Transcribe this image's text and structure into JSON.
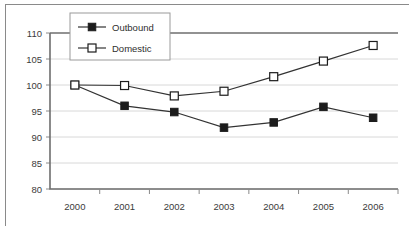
{
  "chart_data": {
    "type": "line",
    "title": "",
    "xlabel": "",
    "ylabel": "",
    "categories": [
      "2000",
      "2001",
      "2002",
      "2003",
      "2004",
      "2005",
      "2006"
    ],
    "series": [
      {
        "name": "Outbound",
        "marker": "filled-square",
        "values": [
          100.0,
          96.0,
          94.8,
          91.8,
          92.8,
          95.8,
          93.7
        ]
      },
      {
        "name": "Domestic",
        "marker": "open-square",
        "values": [
          100.0,
          99.9,
          97.9,
          98.8,
          101.6,
          104.6,
          107.6
        ]
      }
    ],
    "ylim": [
      80,
      110
    ],
    "yticks": [
      80,
      85,
      90,
      95,
      100,
      105,
      110
    ],
    "ytick_labels": [
      "80",
      "85",
      "90",
      "95",
      "100",
      "105",
      "110"
    ],
    "grid": true,
    "legend_position": "top-left-inside",
    "colors": {
      "outbound_marker": "#1c1c1c",
      "domestic_marker": "#ffffff",
      "line": "#333333",
      "gridline": "#d8d8d8",
      "axis": "#6e6e6e",
      "border": "#8a8a8a",
      "text": "#3b3b3b",
      "background": "#ffffff"
    }
  },
  "legend": {
    "items": [
      {
        "label": "Outbound"
      },
      {
        "label": "Domestic"
      }
    ]
  }
}
